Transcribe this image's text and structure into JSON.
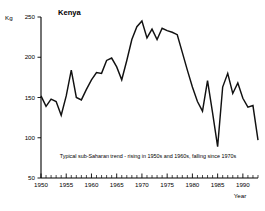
{
  "chart_data": {
    "type": "line",
    "title": "Kenya",
    "xlabel": "Year",
    "ylabel": "Kg",
    "xlim": [
      1950,
      1993
    ],
    "ylim": [
      50,
      250
    ],
    "grid": false,
    "legend": null,
    "y_ticks": [
      50,
      100,
      150,
      200,
      250
    ],
    "y_tick_labels": [
      "50",
      "100",
      "150",
      "200",
      "250"
    ],
    "x_ticks": [
      1950,
      1955,
      1960,
      1965,
      1970,
      1975,
      1980,
      1985,
      1990
    ],
    "x_tick_labels": [
      "1950",
      "1955",
      "1960",
      "1965",
      "1970",
      "1975",
      "1980",
      "1985",
      "1990"
    ],
    "x_minor_tick_step": 1,
    "annotation": "Typical sub-Saharan trend - rising in 1950s and 1960s, falling since 1970s",
    "x": [
      1950,
      1951,
      1952,
      1953,
      1954,
      1955,
      1956,
      1957,
      1958,
      1959,
      1960,
      1961,
      1962,
      1963,
      1964,
      1965,
      1966,
      1967,
      1968,
      1969,
      1970,
      1971,
      1972,
      1973,
      1974,
      1975,
      1976,
      1977,
      1978,
      1979,
      1980,
      1981,
      1982,
      1983,
      1984,
      1985,
      1986,
      1987,
      1988,
      1989,
      1990,
      1991,
      1992,
      1993
    ],
    "values": [
      152,
      139,
      148,
      145,
      128,
      152,
      184,
      150,
      147,
      160,
      172,
      181,
      180,
      196,
      199,
      188,
      172,
      196,
      222,
      238,
      245,
      224,
      235,
      222,
      236,
      233,
      231,
      228,
      206,
      184,
      163,
      145,
      133,
      171,
      131,
      89,
      163,
      180,
      155,
      168,
      149,
      138,
      140,
      97
    ]
  }
}
